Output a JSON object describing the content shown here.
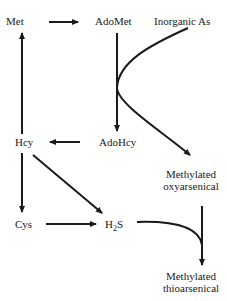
{
  "diagram": {
    "nodes": {
      "met": {
        "label": "Met"
      },
      "adomet": {
        "label": "AdoMet"
      },
      "inorganic_as": {
        "label": "Inorganic As"
      },
      "adohcy": {
        "label": "AdoHcy"
      },
      "hcy": {
        "label": "Hcy"
      },
      "methylated_oxy": {
        "line1": "Methylated",
        "line2": "oxyarsenical"
      },
      "cys": {
        "label": "Cys"
      },
      "h2s": {
        "base": "H",
        "sub": "2",
        "tail": "S"
      },
      "methylated_thio": {
        "line1": "Methylated",
        "line2": "thioarsenical"
      }
    },
    "edges": [
      {
        "from": "Met",
        "to": "AdoMet"
      },
      {
        "from": "AdoMet",
        "to": "AdoHcy"
      },
      {
        "from": "Inorganic As",
        "to": "Methylated oxyarsenical",
        "via": "AdoMet"
      },
      {
        "from": "AdoHcy",
        "to": "Hcy"
      },
      {
        "from": "Hcy",
        "to": "Met"
      },
      {
        "from": "Hcy",
        "to": "Cys"
      },
      {
        "from": "Hcy",
        "to": "H2S"
      },
      {
        "from": "Cys",
        "to": "H2S"
      },
      {
        "from": "Methylated oxyarsenical",
        "to": "Methylated thioarsenical",
        "via": "H2S"
      }
    ],
    "colors": {
      "stroke": "#1a1a1a",
      "background": "#ffffff"
    }
  }
}
